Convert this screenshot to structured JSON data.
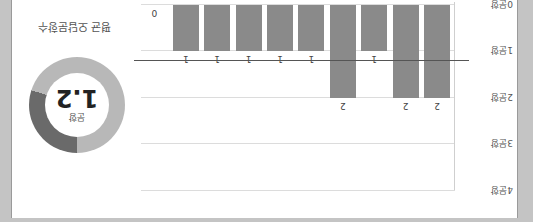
{
  "chart_data": {
    "type": "bar",
    "title": "",
    "categories": [
      "1",
      "2",
      "3",
      "4",
      "5",
      "6",
      "7",
      "8",
      "9",
      "10"
    ],
    "values": [
      2,
      2,
      1,
      2,
      1,
      1,
      1,
      1,
      1,
      0
    ],
    "ylabel": "",
    "xlabel": "",
    "ylim": [
      0,
      4
    ],
    "yticks": [
      "0문항",
      "1문항",
      "2문항",
      "3문항",
      "4문항"
    ],
    "average_line": 1.2,
    "bar_color": "#8a8a8a",
    "grid": true
  },
  "summary": {
    "title": "평균 오답문항수",
    "value": "1.2",
    "unit": "문항",
    "max": 4,
    "colors": {
      "filled": "#6a6a6a",
      "rest": "#b8b8b8"
    }
  }
}
